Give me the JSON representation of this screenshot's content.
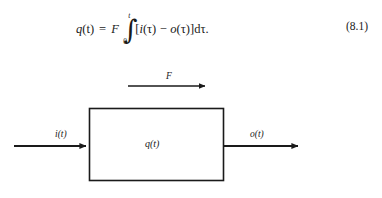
{
  "page": {
    "background_color": "#ffffff",
    "ink_color": "#1a1a1a"
  },
  "equation": {
    "number": "(8.1)",
    "lhs_function": "q",
    "lhs_arg": "(t)",
    "equals": "=",
    "gain_symbol": "F",
    "integral_glyph": "∫",
    "integral_upper_limit": "t",
    "integral_lower_limit": "0",
    "bracket_open": "[",
    "term1_function": "i",
    "term1_arg": "(τ)",
    "minus": "−",
    "term2_function": "o",
    "term2_arg": "(τ)",
    "bracket_close": "]",
    "differential": "d",
    "differential_var": "τ",
    "period": ".",
    "plain_text": "q(t) = F ∫₀ᵗ [i(τ) − o(τ)]dτ."
  },
  "diagram": {
    "flow_arrow_label": "F",
    "input_label": "i(t)",
    "output_label": "o(t)",
    "block_label": "q(t)",
    "line_color": "#1a1a1a"
  }
}
